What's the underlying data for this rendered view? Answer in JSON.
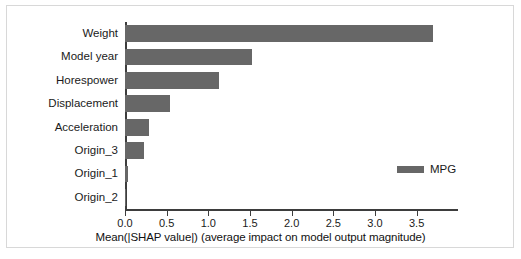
{
  "chart_data": {
    "type": "bar",
    "orientation": "horizontal",
    "title": "",
    "xlabel": "Mean(|SHAP value|) (average impact on model output magnitude)",
    "ylabel": "",
    "categories": [
      "Weight",
      "Model year",
      "Horespower",
      "Displacement",
      "Acceleration",
      "Origin_3",
      "Origin_1",
      "Origin_2"
    ],
    "values": [
      3.69,
      1.52,
      1.13,
      0.54,
      0.29,
      0.23,
      0.04,
      0.005
    ],
    "series": [
      {
        "name": "MPG",
        "color": "#676767",
        "values": [
          3.69,
          1.52,
          1.13,
          0.54,
          0.29,
          0.23,
          0.04,
          0.005
        ]
      }
    ],
    "xlim": [
      0.0,
      3.84
    ],
    "xticks": [
      0.0,
      0.5,
      1.0,
      1.5,
      2.0,
      2.5,
      3.0,
      3.5
    ],
    "xticklabels": [
      "0.0",
      "0.5",
      "1.0",
      "1.5",
      "2.0",
      "2.5",
      "3.0",
      "3.5"
    ],
    "grid": false,
    "legend": {
      "position": "center-right",
      "entries": [
        {
          "label": "MPG",
          "color": "#676767"
        }
      ]
    },
    "bar_color": "#676767",
    "axis_color": "#3d3d3d",
    "background": "#ffffff"
  }
}
